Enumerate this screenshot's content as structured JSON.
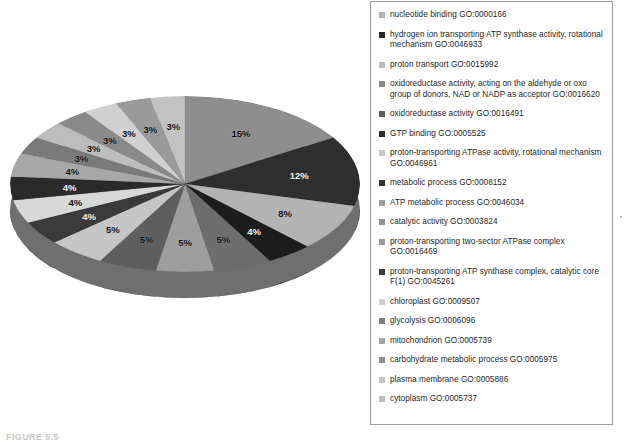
{
  "figure": {
    "caption": "FIGURE 5.5"
  },
  "chart_data": {
    "type": "pie",
    "title": "",
    "legend_position": "right",
    "grid": false,
    "value_suffix": "%",
    "categories": [
      "nucleotide binding GO:0000166",
      "hydrogen ion transporting ATP synthase activity, rotational mechanism GO:0046933",
      "proton transport GO:0015992",
      "oxidoreductase activity, acting on the aldehyde or oxo group of donors, NAD or NADP as acceptor GO:0016620",
      "oxidoreductase activity GO:0016491",
      "GTP binding GO:0005525",
      "proton-transporting ATPase activity, rotational mechanism GO:0046961",
      "metabolic process GO:0008152",
      "ATP metabolic process GO:0046034",
      "catalytic activity GO:0003824",
      "proton-transporting two-sector ATPase complex GO:0016469",
      "proton-transporting ATP synthase complex, catalytic core F(1) GO:0045261",
      "chloroplast GO:0009507",
      "glycolysis GO:0006096",
      "mitochondrion GO:0005739",
      "carbohydrate metabolic process GO:0005975",
      "plasma membrane GO:0005886",
      "cytoplasm GO:0005737"
    ],
    "values": [
      15,
      12,
      8,
      4,
      5,
      5,
      5,
      5,
      4,
      4,
      4,
      4,
      3,
      3,
      3,
      3,
      3,
      3
    ],
    "labels": [
      "15%",
      "12%",
      "8%",
      "4%",
      "5%",
      "5%",
      "5%",
      "5%",
      "4%",
      "4%",
      "4%",
      "4%",
      "3%",
      "3%",
      "3%",
      "3%",
      "3%",
      "3%"
    ],
    "slice_colors": [
      "#8e8e8e",
      "#2e2e2e",
      "#b3b3b3",
      "#1c1c1c",
      "#6d6d6d",
      "#9e9e9e",
      "#5e5e5e",
      "#c6c6c6",
      "#3a3a3a",
      "#d8d8d8",
      "#2a2a2a",
      "#a8a8a8",
      "#7a7a7a",
      "#bdbdbd",
      "#8a8a8a",
      "#d0d0d0",
      "#9a9a9a",
      "#c2c2c2"
    ]
  },
  "legend": {
    "items": [
      {
        "label": "nucleotide binding GO:0000166",
        "swatch": "#b0b0b0"
      },
      {
        "label": "hydrogen ion transporting ATP synthase activity, rotational mechanism GO:0046933",
        "swatch": "#262626"
      },
      {
        "label": "proton transport GO:0015992",
        "swatch": "#bcbcbc"
      },
      {
        "label": "oxidoreductase activity, acting on the aldehyde or oxo group of donors, NAD or NADP as acceptor GO:0016620",
        "swatch": "#8a8a8a"
      },
      {
        "label": "oxidoreductase activity GO:0016491",
        "swatch": "#5c5c5c"
      },
      {
        "label": "GTP binding GO:0005525",
        "swatch": "#2d2d2d"
      },
      {
        "label": "proton-transporting ATPase activity, rotational mechanism GO:0046961",
        "swatch": "#c8c8c8"
      },
      {
        "label": "metabolic process GO:0008152",
        "swatch": "#333333"
      },
      {
        "label": "ATP metabolic process GO:0046034",
        "swatch": "#9d9d9d"
      },
      {
        "label": "catalytic activity GO:0003824",
        "swatch": "#8f8f8f"
      },
      {
        "label": "proton-transporting two-sector ATPase complex GO:0016469",
        "swatch": "#9a9a9a"
      },
      {
        "label": "proton-transporting ATP synthase complex, catalytic core F(1) GO:0045261",
        "swatch": "#3c3c3c"
      },
      {
        "label": "chloroplast GO:0009507",
        "swatch": "#cfcfcf"
      },
      {
        "label": "glycolysis GO:0006096",
        "swatch": "#7d7d7d"
      },
      {
        "label": "mitochondrion GO:0005739",
        "swatch": "#a6a6a6"
      },
      {
        "label": "carbohydrate metabolic process GO:0005975",
        "swatch": "#8b8b8b"
      },
      {
        "label": "plasma membrane GO:0005886",
        "swatch": "#c4c4c4"
      },
      {
        "label": "cytoplasm GO:0005737",
        "swatch": "#bfbfbf"
      }
    ]
  }
}
